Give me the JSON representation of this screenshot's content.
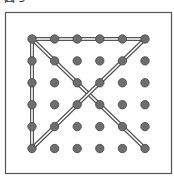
{
  "figure": {
    "title": "図 5",
    "grid": {
      "rows": 6,
      "cols": 6
    },
    "dot_color": "#6e6e6e",
    "line_color": "#555555",
    "segments": [
      {
        "from": [
          0,
          0
        ],
        "to": [
          5,
          0
        ]
      },
      {
        "from": [
          0,
          0
        ],
        "to": [
          0,
          5
        ]
      },
      {
        "from": [
          0,
          0
        ],
        "to": [
          5,
          5
        ]
      },
      {
        "from": [
          5,
          0
        ],
        "to": [
          0,
          5
        ]
      }
    ]
  }
}
